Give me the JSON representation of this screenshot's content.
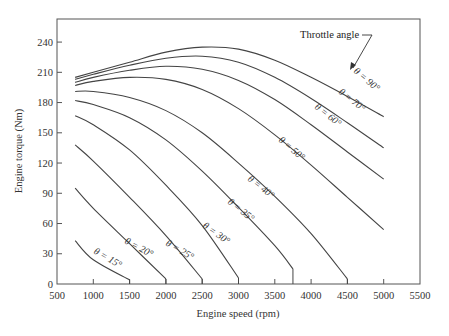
{
  "chart_data": {
    "type": "line",
    "title": "",
    "xlabel": "Engine speed (rpm)",
    "ylabel": "Engine torque (Nm)",
    "xlim": [
      500,
      5500
    ],
    "ylim": [
      0,
      255
    ],
    "xticks": [
      500,
      1000,
      1500,
      2000,
      2500,
      3000,
      3500,
      4000,
      4500,
      5000,
      5500
    ],
    "yticks": [
      0,
      30,
      60,
      90,
      120,
      150,
      180,
      210,
      240
    ],
    "grid": false,
    "legend": "inline curve labels",
    "annotation": "Throttle angle",
    "series": [
      {
        "name": "θ = 90°",
        "x": [
          750,
          1000,
          1500,
          2000,
          2500,
          3000,
          3500,
          4000,
          4500,
          5000
        ],
        "y": [
          205,
          210,
          220,
          230,
          235,
          233,
          222,
          205,
          186,
          166
        ]
      },
      {
        "name": "θ = 70°",
        "x": [
          750,
          1000,
          1500,
          2000,
          2500,
          3000,
          3500,
          4000,
          4500,
          5000
        ],
        "y": [
          203,
          208,
          217,
          224,
          226,
          220,
          205,
          184,
          160,
          135
        ]
      },
      {
        "name": "θ = 60°",
        "x": [
          750,
          1000,
          1500,
          2000,
          2500,
          3000,
          3500,
          4000,
          4500,
          5000
        ],
        "y": [
          200,
          205,
          212,
          216,
          213,
          202,
          183,
          158,
          131,
          104
        ]
      },
      {
        "name": "θ = 50°",
        "x": [
          750,
          1000,
          1500,
          2000,
          2500,
          3000,
          3500,
          4000,
          4500,
          5000
        ],
        "y": [
          197,
          201,
          205,
          203,
          193,
          174,
          148,
          118,
          86,
          54
        ]
      },
      {
        "name": "θ = 40°",
        "x": [
          750,
          1000,
          1500,
          2000,
          2500,
          3000,
          3500,
          4000,
          4500
        ],
        "y": [
          191,
          191,
          185,
          172,
          150,
          120,
          87,
          50,
          5
        ]
      },
      {
        "name": "θ = 35°",
        "x": [
          750,
          1000,
          1500,
          2000,
          2500,
          3000,
          3500,
          3750
        ],
        "y": [
          182,
          178,
          165,
          143,
          112,
          76,
          38,
          15
        ]
      },
      {
        "name": "θ = 30°",
        "x": [
          750,
          1000,
          1500,
          2000,
          2500,
          3000
        ],
        "y": [
          167,
          158,
          133,
          98,
          58,
          6
        ]
      },
      {
        "name": "θ = 25°",
        "x": [
          750,
          1000,
          1500,
          2000,
          2500
        ],
        "y": [
          138,
          122,
          86,
          48,
          5
        ]
      },
      {
        "name": "θ = 20°",
        "x": [
          750,
          1000,
          1500,
          2000
        ],
        "y": [
          95,
          75,
          40,
          5
        ]
      },
      {
        "name": "θ = 15°",
        "x": [
          750,
          1000,
          1500
        ],
        "y": [
          43,
          24,
          4
        ]
      }
    ]
  },
  "labels": {
    "xlabel": "Engine speed (rpm)",
    "ylabel": "Engine torque (Nm)",
    "annotation": "Throttle angle",
    "curves": [
      "θ = 90°",
      "θ = 70°",
      "θ = 60°",
      "θ = 50°",
      "θ = 40°",
      "θ = 35°",
      "θ = 30°",
      "θ = 25°",
      "θ = 20°",
      "θ = 15°"
    ]
  }
}
